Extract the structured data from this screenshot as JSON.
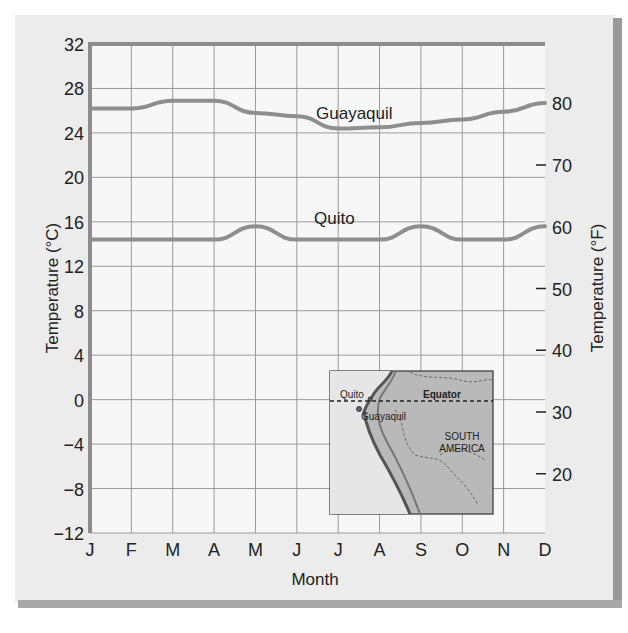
{
  "chart_data": {
    "type": "line",
    "title": "",
    "xlabel": "Month",
    "ylabel": "Temperature (°C)",
    "ylabel_right": "Temperature (°F)",
    "categories": [
      "J",
      "F",
      "M",
      "A",
      "M",
      "J",
      "J",
      "A",
      "S",
      "O",
      "N",
      "D"
    ],
    "ylim": [
      -12,
      32
    ],
    "yticks": [
      32,
      28,
      24,
      20,
      16,
      12,
      8,
      4,
      0,
      -4,
      -8,
      -12
    ],
    "yticks_labels": [
      "32",
      "28",
      "24",
      "20",
      "16",
      "12",
      "8",
      "4",
      "0",
      "−4",
      "−8",
      "−12"
    ],
    "yticks_right": [
      80,
      70,
      60,
      50,
      40,
      30,
      20
    ],
    "grid": true,
    "series": [
      {
        "name": "Guayaquil",
        "color": "#8e8e8e",
        "values": [
          26.2,
          26.2,
          26.9,
          26.9,
          25.8,
          25.5,
          24.4,
          24.5,
          24.9,
          25.2,
          25.9,
          26.7
        ]
      },
      {
        "name": "Quito",
        "color": "#8e8e8e",
        "values": [
          14.4,
          14.4,
          14.4,
          14.4,
          15.6,
          14.4,
          14.4,
          14.4,
          15.6,
          14.4,
          14.4,
          15.6
        ]
      }
    ],
    "annotations": [
      "Guayaquil",
      "Quito"
    ],
    "inset_map": {
      "labels": [
        "Quito",
        "Guayaquil",
        "Equator",
        "SOUTH",
        "AMERICA"
      ]
    }
  },
  "labels": {
    "guayaquil": "Guayaquil",
    "quito": "Quito",
    "xlabel": "Month",
    "ylabel_left": "Temperature (°C)",
    "ylabel_right": "Temperature (°F)",
    "map_quito": "Quito",
    "map_guayaquil": "Guayaquil",
    "map_equator": "Equator",
    "map_south": "SOUTH",
    "map_america": "AMERICA"
  }
}
